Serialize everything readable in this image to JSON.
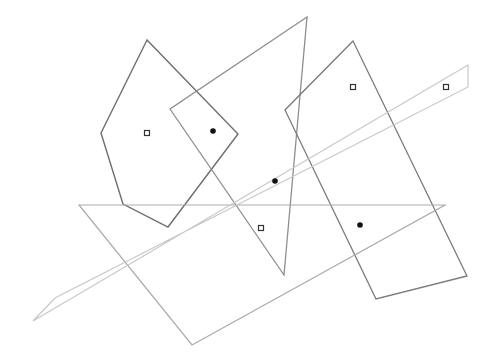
{
  "canvas": {
    "width": 498,
    "height": 360,
    "background": "#ffffff"
  },
  "shapes": [
    {
      "name": "hexagon",
      "points": [
        [
          147,
          40
        ],
        [
          101,
          133
        ],
        [
          123,
          204
        ],
        [
          168,
          227
        ],
        [
          238,
          134
        ]
      ],
      "stroke": "#6e6e6e",
      "stroke_width": 1.4
    },
    {
      "name": "triangle",
      "points": [
        [
          307,
          17
        ],
        [
          170,
          109
        ],
        [
          284,
          275
        ]
      ],
      "stroke": "#8e8e8e",
      "stroke_width": 1.3
    },
    {
      "name": "rectangle",
      "points": [
        [
          353,
          41
        ],
        [
          285,
          110
        ],
        [
          376,
          299
        ],
        [
          467,
          276
        ]
      ],
      "stroke": "#7a7a7a",
      "stroke_width": 1.3
    },
    {
      "name": "large-triangle",
      "points": [
        [
          79,
          205
        ],
        [
          445,
          205
        ],
        [
          192,
          345
        ]
      ],
      "stroke": "#ababab",
      "stroke_width": 1.2
    },
    {
      "name": "strip",
      "points": [
        [
          468,
          65
        ],
        [
          468,
          87
        ],
        [
          55,
          298
        ],
        [
          33,
          321
        ]
      ],
      "stroke": "#c8c8c8",
      "stroke_width": 1.2
    }
  ],
  "markers": [
    {
      "type": "square",
      "x": 147,
      "y": 133
    },
    {
      "type": "square",
      "x": 261,
      "y": 228
    },
    {
      "type": "square",
      "x": 353,
      "y": 87
    },
    {
      "type": "square",
      "x": 446,
      "y": 87
    },
    {
      "type": "dot",
      "x": 213,
      "y": 131
    },
    {
      "type": "dot",
      "x": 275,
      "y": 181
    },
    {
      "type": "dot",
      "x": 360,
      "y": 225
    }
  ]
}
